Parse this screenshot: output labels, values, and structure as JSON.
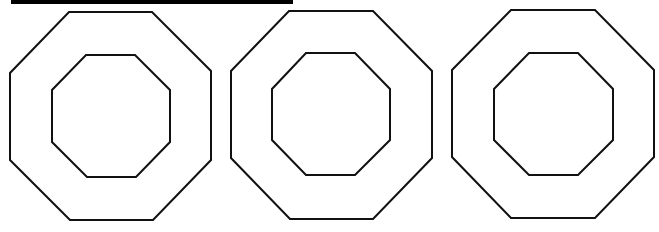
{
  "figure": {
    "width": 659,
    "height": 232,
    "background": "#ffffff",
    "stroke_color": "#111111",
    "top_bar": {
      "color": "#000000"
    },
    "shapes": [
      {
        "name": "octagon-ring-1",
        "outer": "69,12 152,12 211,71 211,160 153,220 70,220 10,160 10,73",
        "inner": "86,55 135,55 170,90 170,142 136,177 87,177 52,142 52,90"
      },
      {
        "name": "octagon-ring-2",
        "outer": "289,11 373,11 432,71 432,158 373,219 290,219 231,158 231,71",
        "inner": "306,53 355,53 390,89 390,140 355,175 306,175 272,140 272,89"
      },
      {
        "name": "octagon-ring-3",
        "outer": "511,10 595,10 654,70 654,157 595,218 511,218 452,157 452,70",
        "inner": "529,53 578,53 613,89 613,140 578,175 529,175 494,140 494,89"
      }
    ]
  }
}
